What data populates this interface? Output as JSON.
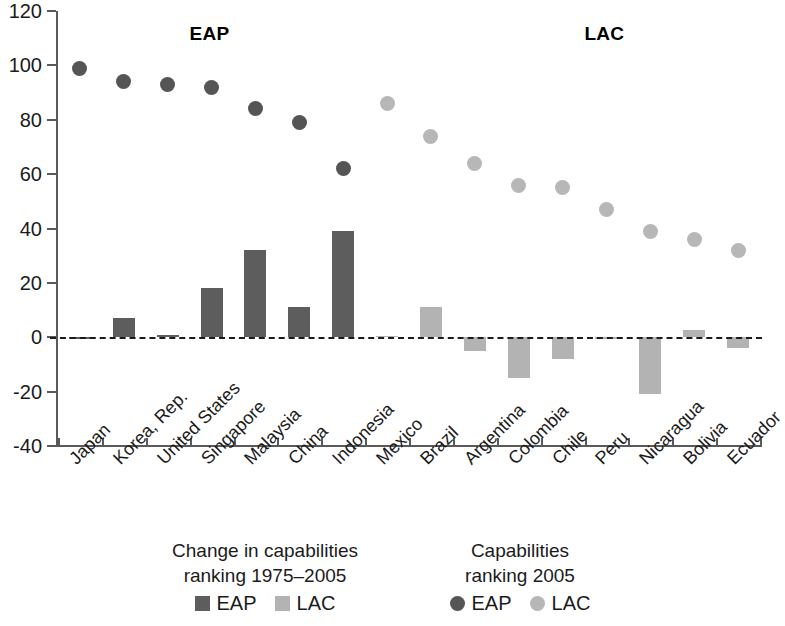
{
  "chart_data": {
    "type": "bar",
    "title": "",
    "xlabel": "",
    "ylabel": "",
    "ylim": [
      -40,
      120
    ],
    "ytick_labels": [
      "120",
      "100",
      "80",
      "60",
      "40",
      "20",
      "0",
      "-20",
      "-40"
    ],
    "ytick_values": [
      120,
      100,
      80,
      60,
      40,
      20,
      0,
      -20,
      -40
    ],
    "grid": false,
    "zero_reference_line": true,
    "categories": [
      "Japan",
      "Korea, Rep.",
      "United States",
      "Singapore",
      "Malaysia",
      "China",
      "Indonesia",
      "Mexico",
      "Brazil",
      "Argentina",
      "Colombia",
      "Chile",
      "Peru",
      "Nicaragua",
      "Bolivia",
      "Ecuador"
    ],
    "groups": [
      "EAP",
      "EAP",
      "EAP",
      "EAP",
      "EAP",
      "EAP",
      "EAP",
      "LAC",
      "LAC",
      "LAC",
      "LAC",
      "LAC",
      "LAC",
      "LAC",
      "LAC",
      "LAC"
    ],
    "series": [
      {
        "name": "Change in capabilities ranking 1975-2005",
        "kind": "bar",
        "values": [
          0,
          7,
          1,
          18,
          32,
          11,
          39,
          0.5,
          11,
          -5,
          -15,
          -8,
          -0.5,
          -21,
          2.5,
          -4
        ]
      },
      {
        "name": "Capabilities ranking 2005",
        "kind": "scatter",
        "values": [
          99,
          94,
          93,
          92,
          84,
          79,
          62,
          86,
          74,
          64,
          56,
          55,
          47,
          39,
          36,
          32
        ]
      }
    ],
    "annotations": [
      {
        "text": "EAP",
        "x_category": "Singapore",
        "y": 112
      },
      {
        "text": "LAC",
        "x_category": "Peru",
        "y": 112
      }
    ],
    "legend": {
      "position": "bottom",
      "blocks": [
        {
          "title_line1": "Change in capabilities",
          "title_line2": "ranking 1975–2005",
          "keys": [
            {
              "label": "EAP",
              "marker": "square",
              "color": "#5d5d5d"
            },
            {
              "label": "LAC",
              "marker": "square",
              "color": "#b3b3b3"
            }
          ]
        },
        {
          "title_line1": "Capabilities",
          "title_line2": "ranking 2005",
          "keys": [
            {
              "label": "EAP",
              "marker": "circle",
              "color": "#555555"
            },
            {
              "label": "LAC",
              "marker": "circle",
              "color": "#b7b7b7"
            }
          ]
        }
      ]
    },
    "colors": {
      "eap_bar": "#5d5d5d",
      "lac_bar": "#b3b3b3",
      "eap_dot": "#555555",
      "lac_dot": "#b7b7b7",
      "axis": "#5a5a5a",
      "text": "#1b1b1b",
      "background": "#ffffff"
    }
  }
}
